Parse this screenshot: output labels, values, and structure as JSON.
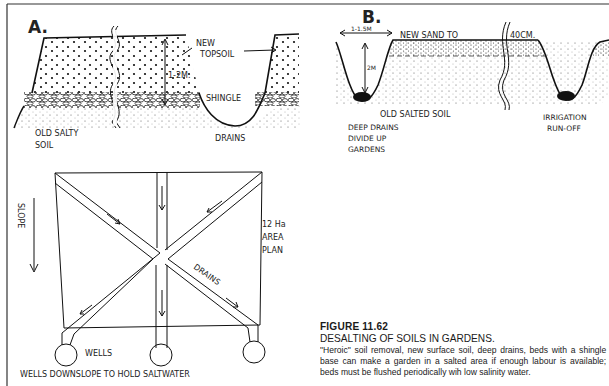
{
  "panel_a": {
    "label": "A.",
    "topsoil_label_1": "NEW",
    "topsoil_label_2": "TOPSOIL",
    "depth_label": "1-2M.",
    "shingle_label": "SHINGLE",
    "old_soil_label_1": "OLD SALTY",
    "old_soil_label_2": "SOIL",
    "drains_label": "DRAINS"
  },
  "panel_b": {
    "label": "B.",
    "width_label": "1-1.5M",
    "sand_label": "NEW SAND TO",
    "sand_depth_label": "40CM.",
    "drain_depth_label": "2M",
    "old_soil_label": "OLD SALTED SOIL",
    "deep_drains_label_1": "DEEP DRAINS",
    "deep_drains_label_2": "DIVIDE UP",
    "deep_drains_label_3": "GARDENS",
    "irrigation_label_1": "IRRIGATION",
    "irrigation_label_2": "RUN-OFF"
  },
  "panel_plan": {
    "slope_label": "SLOPE",
    "area_label_1": "12 Ha",
    "area_label_2": "AREA",
    "area_label_3": "PLAN",
    "drains_label": "DRAINS",
    "wells_label": "WELLS",
    "wells_note": "WELLS DOWNSLOPE TO HOLD SALTWATER"
  },
  "caption": {
    "figure_number": "FIGURE 11.62",
    "title": "DESALTING OF SOILS IN GARDENS.",
    "description": "\"Heroic\" soil removal, new surface soil, deep drains, beds with a shingle base can make a garden in a  salted area if enough labour is available; beds must be flushed periodically wih low salinity water."
  }
}
